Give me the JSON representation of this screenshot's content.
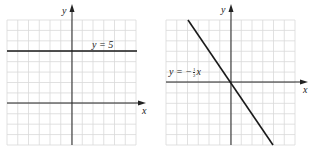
{
  "graphs": [
    {
      "id": "left",
      "x_axis_label": "x",
      "y_axis_label": "y",
      "line_label": "y = 5",
      "equation": "y = 5",
      "grid": {
        "x_range": [
          -6,
          6
        ],
        "y_range": [
          -4,
          8
        ],
        "step": 1
      }
    },
    {
      "id": "right",
      "x_axis_label": "x",
      "y_axis_label": "y",
      "line_label_prefix": "y = −",
      "line_label_num": "1",
      "line_label_den": "2",
      "line_label_suffix": "x",
      "equation": "y = -1/2 x",
      "grid": {
        "x_range": [
          -6,
          6
        ],
        "y_range": [
          -6,
          6
        ],
        "step": 1
      }
    }
  ],
  "colors": {
    "grid": "#d9d9d9",
    "axis": "#222222",
    "line": "#1a1a1a"
  },
  "chart_data": [
    {
      "type": "line",
      "title": "",
      "xlabel": "x",
      "ylabel": "y",
      "grid": true,
      "xlim": [
        -6,
        6
      ],
      "ylim": [
        -4,
        8
      ],
      "series": [
        {
          "name": "y = 5",
          "x": [
            -6,
            6
          ],
          "y": [
            5,
            5
          ]
        }
      ],
      "annotations": [
        "y = 5"
      ]
    },
    {
      "type": "line",
      "title": "",
      "xlabel": "x",
      "ylabel": "y",
      "grid": true,
      "xlim": [
        -6,
        6
      ],
      "ylim": [
        -6,
        6
      ],
      "series": [
        {
          "name": "y = -1/2 x",
          "x": [
            -4,
            4
          ],
          "y": [
            6,
            -6
          ]
        }
      ],
      "annotations": [
        "y = − 1/2 x"
      ]
    }
  ]
}
